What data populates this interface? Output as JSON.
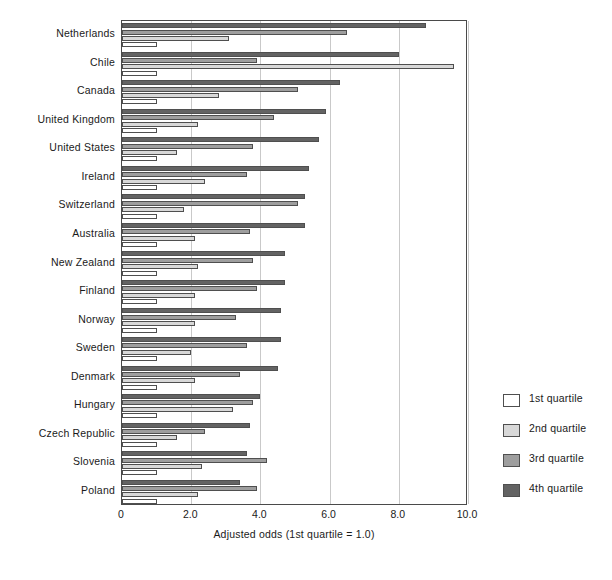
{
  "chart_data": {
    "type": "bar",
    "orientation": "horizontal",
    "title": "",
    "xlabel": "Adjusted odds (1st quartile = 1.0)",
    "ylabel": "",
    "xlim": [
      0,
      10.0
    ],
    "xticks": [
      "0",
      "2.0",
      "4.0",
      "6.0",
      "8.0",
      "10.0"
    ],
    "xtick_values": [
      0,
      2.0,
      4.0,
      6.0,
      8.0,
      10.0
    ],
    "grid": "vertical",
    "legend_position": "right",
    "categories": [
      "Netherlands",
      "Chile",
      "Canada",
      "United Kingdom",
      "United States",
      "Ireland",
      "Switzerland",
      "Australia",
      "New Zealand",
      "Finland",
      "Norway",
      "Sweden",
      "Denmark",
      "Hungary",
      "Czech Republic",
      "Slovenia",
      "Poland"
    ],
    "series": [
      {
        "name": "1st quartile",
        "color": "#ffffff",
        "values": [
          1.0,
          1.0,
          1.0,
          1.0,
          1.0,
          1.0,
          1.0,
          1.0,
          1.0,
          1.0,
          1.0,
          1.0,
          1.0,
          1.0,
          1.0,
          1.0,
          1.0
        ]
      },
      {
        "name": "2nd quartile",
        "color": "#d8d8d8",
        "values": [
          3.1,
          9.6,
          2.8,
          2.2,
          1.6,
          2.4,
          1.8,
          2.1,
          2.2,
          2.1,
          2.1,
          2.0,
          2.1,
          3.2,
          1.6,
          2.3,
          2.2
        ]
      },
      {
        "name": "3rd quartile",
        "color": "#9e9e9e",
        "values": [
          6.5,
          3.9,
          5.1,
          4.4,
          3.8,
          3.6,
          5.1,
          3.7,
          3.8,
          3.9,
          3.3,
          3.6,
          3.4,
          3.8,
          2.4,
          4.2,
          3.9
        ]
      },
      {
        "name": "4th quartile",
        "color": "#636363",
        "values": [
          8.8,
          8.0,
          6.3,
          5.9,
          5.7,
          5.4,
          5.3,
          5.3,
          4.7,
          4.7,
          4.6,
          4.6,
          4.5,
          4.0,
          3.7,
          3.6,
          3.4
        ]
      }
    ]
  },
  "legend": {
    "items": [
      {
        "label": "1st quartile",
        "color": "#ffffff"
      },
      {
        "label": "2nd quartile",
        "color": "#d8d8d8"
      },
      {
        "label": "3rd quartile",
        "color": "#9e9e9e"
      },
      {
        "label": "4th quartile",
        "color": "#636363"
      }
    ]
  }
}
